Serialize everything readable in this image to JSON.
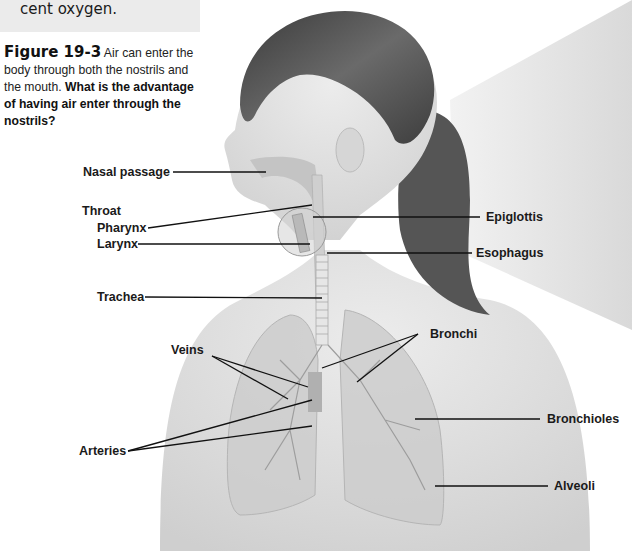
{
  "top_box": {
    "text": "cent oxygen."
  },
  "caption": {
    "figure_label": "Figure 19-3",
    "text": " Air can enter the body through both the nostrils and the mouth. ",
    "question": "What is the advantage of having air enter through the nostrils?"
  },
  "diagram": {
    "labels": {
      "nasal_passage": "Nasal passage",
      "throat": "Throat",
      "pharynx": "Pharynx",
      "larynx": "Larynx",
      "trachea": "Trachea",
      "veins": "Veins",
      "arteries": "Arteries",
      "epiglottis": "Epiglottis",
      "esophagus": "Esophagus",
      "bronchi": "Bronchi",
      "bronchioles": "Bronchioles",
      "alveoli": "Alveoli"
    },
    "colors": {
      "skin": "#dcdcdc",
      "hair": "#4a4a4a",
      "beam": "#e4e4e4",
      "lung": "#cfcfcf",
      "leader_line": "#111111"
    }
  }
}
